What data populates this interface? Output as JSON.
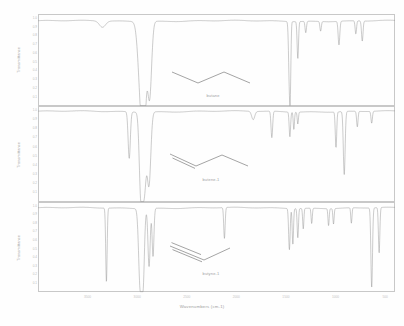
{
  "figure": {
    "title": "",
    "xlabel": "Wavenumbers (cm-1)",
    "ylabel": "Transmittance",
    "trace_color": "#8c8c8c",
    "frame_color": "#c8c8c8",
    "background": "#fefefe"
  },
  "axis": {
    "x_ticks": [
      {
        "label": "3500",
        "value": 3500
      },
      {
        "label": "3000",
        "value": 3000
      },
      {
        "label": "2500",
        "value": 2500
      },
      {
        "label": "2000",
        "value": 2000
      },
      {
        "label": "1500",
        "value": 1500
      },
      {
        "label": "1000",
        "value": 1000
      },
      {
        "label": "500",
        "value": 500
      }
    ],
    "x_range": [
      4000,
      400
    ],
    "y_ticks": [
      "1.0",
      "0.9",
      "0.8",
      "0.7",
      "0.6",
      "0.5",
      "0.4",
      "0.3",
      "0.2",
      "0.1"
    ],
    "y_range": [
      0,
      1.05
    ]
  },
  "panels": [
    {
      "id": "butane",
      "molecule_label": "butane",
      "ylabel": "Transmittance",
      "structure": "skeletal-zigzag-4-carbon-single-bonds"
    },
    {
      "id": "butene-1",
      "molecule_label": "butene-1",
      "ylabel": "Transmittance",
      "structure": "skeletal-zigzag-4-carbon-terminal-double-bond"
    },
    {
      "id": "butyne-1",
      "molecule_label": "butyne-1",
      "ylabel": "Transmittance",
      "structure": "skeletal-4-carbon-terminal-triple-bond"
    }
  ],
  "chart_data": {
    "type": "line",
    "title": "",
    "xlabel": "Wavenumbers (cm-1)",
    "ylabel": "Transmittance",
    "xlim": [
      4000,
      400
    ],
    "ylim": [
      0,
      1.05
    ],
    "grid": false,
    "legend": "none",
    "series": [
      {
        "name": "butane",
        "baseline": 0.97,
        "peaks": [
          {
            "wavenumber": 2960,
            "transmittance": 0.08,
            "width": 55,
            "assignment": "C-H stretch (sp3)"
          },
          {
            "wavenumber": 2930,
            "transmittance": 0.05,
            "width": 40,
            "assignment": "C-H stretch (sp3)"
          },
          {
            "wavenumber": 2875,
            "transmittance": 0.1,
            "width": 40,
            "assignment": "C-H stretch (sp3)"
          },
          {
            "wavenumber": 3350,
            "transmittance": 0.9,
            "width": 60,
            "assignment": "overtone"
          },
          {
            "wavenumber": 1465,
            "transmittance": 0.28,
            "width": 16,
            "assignment": "CH2 bend"
          },
          {
            "wavenumber": 1455,
            "transmittance": 0.42,
            "width": 12,
            "assignment": "CH3 asym bend"
          },
          {
            "wavenumber": 1380,
            "transmittance": 0.55,
            "width": 14,
            "assignment": "CH3 sym bend"
          },
          {
            "wavenumber": 1300,
            "transmittance": 0.84,
            "width": 14,
            "assignment": "CH2 wag"
          },
          {
            "wavenumber": 1150,
            "transmittance": 0.86,
            "width": 14,
            "assignment": "skeletal"
          },
          {
            "wavenumber": 965,
            "transmittance": 0.7,
            "width": 16,
            "assignment": "C-C stretch"
          },
          {
            "wavenumber": 795,
            "transmittance": 0.82,
            "width": 14,
            "assignment": "CH2 rock"
          },
          {
            "wavenumber": 730,
            "transmittance": 0.74,
            "width": 15,
            "assignment": "CH2 rock"
          }
        ]
      },
      {
        "name": "butene-1",
        "baseline": 0.99,
        "peaks": [
          {
            "wavenumber": 3080,
            "transmittance": 0.48,
            "width": 22,
            "assignment": "=C-H stretch (sp2)"
          },
          {
            "wavenumber": 2965,
            "transmittance": 0.22,
            "width": 30,
            "assignment": "C-H stretch (sp3)"
          },
          {
            "wavenumber": 2930,
            "transmittance": 0.1,
            "width": 40,
            "assignment": "C-H stretch (sp3)"
          },
          {
            "wavenumber": 2880,
            "transmittance": 0.22,
            "width": 35,
            "assignment": "C-H stretch (sp3)"
          },
          {
            "wavenumber": 1830,
            "transmittance": 0.9,
            "width": 30,
            "assignment": "overtone"
          },
          {
            "wavenumber": 1642,
            "transmittance": 0.7,
            "width": 16,
            "assignment": "C=C stretch"
          },
          {
            "wavenumber": 1460,
            "transmittance": 0.72,
            "width": 14,
            "assignment": "CH2 bend"
          },
          {
            "wavenumber": 1420,
            "transmittance": 0.8,
            "width": 12,
            "assignment": "=CH2 bend"
          },
          {
            "wavenumber": 1380,
            "transmittance": 0.86,
            "width": 12,
            "assignment": "CH3 bend"
          },
          {
            "wavenumber": 995,
            "transmittance": 0.6,
            "width": 14,
            "assignment": "=C-H wag"
          },
          {
            "wavenumber": 912,
            "transmittance": 0.3,
            "width": 18,
            "assignment": "=CH2 wag"
          },
          {
            "wavenumber": 780,
            "transmittance": 0.82,
            "width": 14,
            "assignment": "CH2 rock"
          },
          {
            "wavenumber": 635,
            "transmittance": 0.86,
            "width": 14,
            "assignment": "skeletal"
          }
        ]
      },
      {
        "name": "butyne-1",
        "baseline": 0.98,
        "peaks": [
          {
            "wavenumber": 3310,
            "transmittance": 0.12,
            "width": 14,
            "assignment": "triple-bond C-H stretch (sp)"
          },
          {
            "wavenumber": 2970,
            "transmittance": 0.08,
            "width": 30,
            "assignment": "C-H stretch (sp3)"
          },
          {
            "wavenumber": 2940,
            "transmittance": 0.14,
            "width": 26,
            "assignment": "C-H stretch (sp3)"
          },
          {
            "wavenumber": 2880,
            "transmittance": 0.3,
            "width": 22,
            "assignment": "C-H stretch (sp3)"
          },
          {
            "wavenumber": 2840,
            "transmittance": 0.42,
            "width": 18,
            "assignment": "C-H stretch (sp3)"
          },
          {
            "wavenumber": 2120,
            "transmittance": 0.62,
            "width": 14,
            "assignment": "C-triple-bond-C stretch"
          },
          {
            "wavenumber": 1465,
            "transmittance": 0.5,
            "width": 15,
            "assignment": "CH2 bend"
          },
          {
            "wavenumber": 1430,
            "transmittance": 0.56,
            "width": 13,
            "assignment": "CH2 bend"
          },
          {
            "wavenumber": 1380,
            "transmittance": 0.64,
            "width": 13,
            "assignment": "CH3 bend"
          },
          {
            "wavenumber": 1325,
            "transmittance": 0.74,
            "width": 12,
            "assignment": "C-H bend"
          },
          {
            "wavenumber": 1240,
            "transmittance": 0.8,
            "width": 12,
            "assignment": "skeletal"
          },
          {
            "wavenumber": 1070,
            "transmittance": 0.78,
            "width": 12,
            "assignment": "skeletal"
          },
          {
            "wavenumber": 1020,
            "transmittance": 0.8,
            "width": 12,
            "assignment": "skeletal"
          },
          {
            "wavenumber": 840,
            "transmittance": 0.8,
            "width": 12,
            "assignment": "CH2 rock"
          },
          {
            "wavenumber": 635,
            "transmittance": 0.05,
            "width": 16,
            "assignment": "triple-bond C-H bend"
          },
          {
            "wavenumber": 560,
            "transmittance": 0.45,
            "width": 14,
            "assignment": "skeletal bend"
          }
        ]
      }
    ]
  }
}
